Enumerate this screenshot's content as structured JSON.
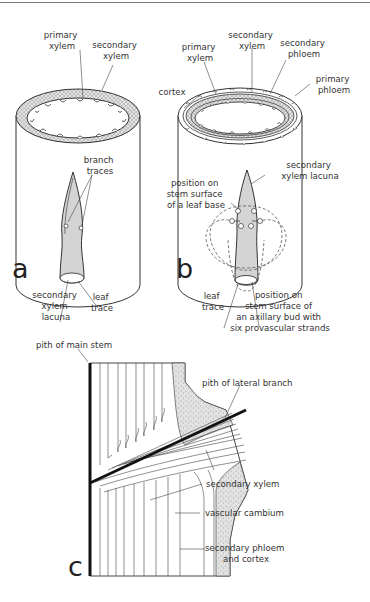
{
  "figure": {
    "panels": [
      {
        "id": "a",
        "letter": "a",
        "labels": {
          "primary_xylem": [
            "primary",
            "xylem"
          ],
          "secondary_xylem": [
            "secondary",
            "xylem"
          ],
          "branch_traces": [
            "branch",
            "traces"
          ],
          "secondary_xylem_lacuna": [
            "secondary",
            "xylem",
            "lacuna"
          ],
          "leaf_trace": [
            "leaf",
            "trace"
          ]
        }
      },
      {
        "id": "b",
        "letter": "b",
        "labels": {
          "primary_xylem": [
            "primary",
            "xylem"
          ],
          "secondary_xylem": [
            "secondary",
            "xylem"
          ],
          "secondary_phloem": [
            "secondary",
            "phloem"
          ],
          "primary_phloem": [
            "primary",
            "phloem"
          ],
          "cortex": [
            "cortex"
          ],
          "secondary_xylem_lacuna": [
            "secondary",
            "xylem lacuna"
          ],
          "leaf_base_position": [
            "position on",
            "stem surface",
            "of a leaf base"
          ],
          "leaf_trace": [
            "leaf",
            "trace"
          ],
          "axillary_bud_position": [
            "position on",
            "stem surface of",
            "an axillary bud with",
            "six provascular  strands"
          ]
        }
      },
      {
        "id": "c",
        "letter": "c",
        "labels": {
          "pith_main_stem": [
            "pith of main stem"
          ],
          "pith_lateral_branch": [
            "pith of lateral branch"
          ],
          "secondary_xylem": [
            "secondary xylem"
          ],
          "vascular_cambium": [
            "vascular cambium"
          ],
          "secondary_phloem_cortex": [
            "secondary phloem",
            "and cortex"
          ]
        }
      }
    ]
  }
}
